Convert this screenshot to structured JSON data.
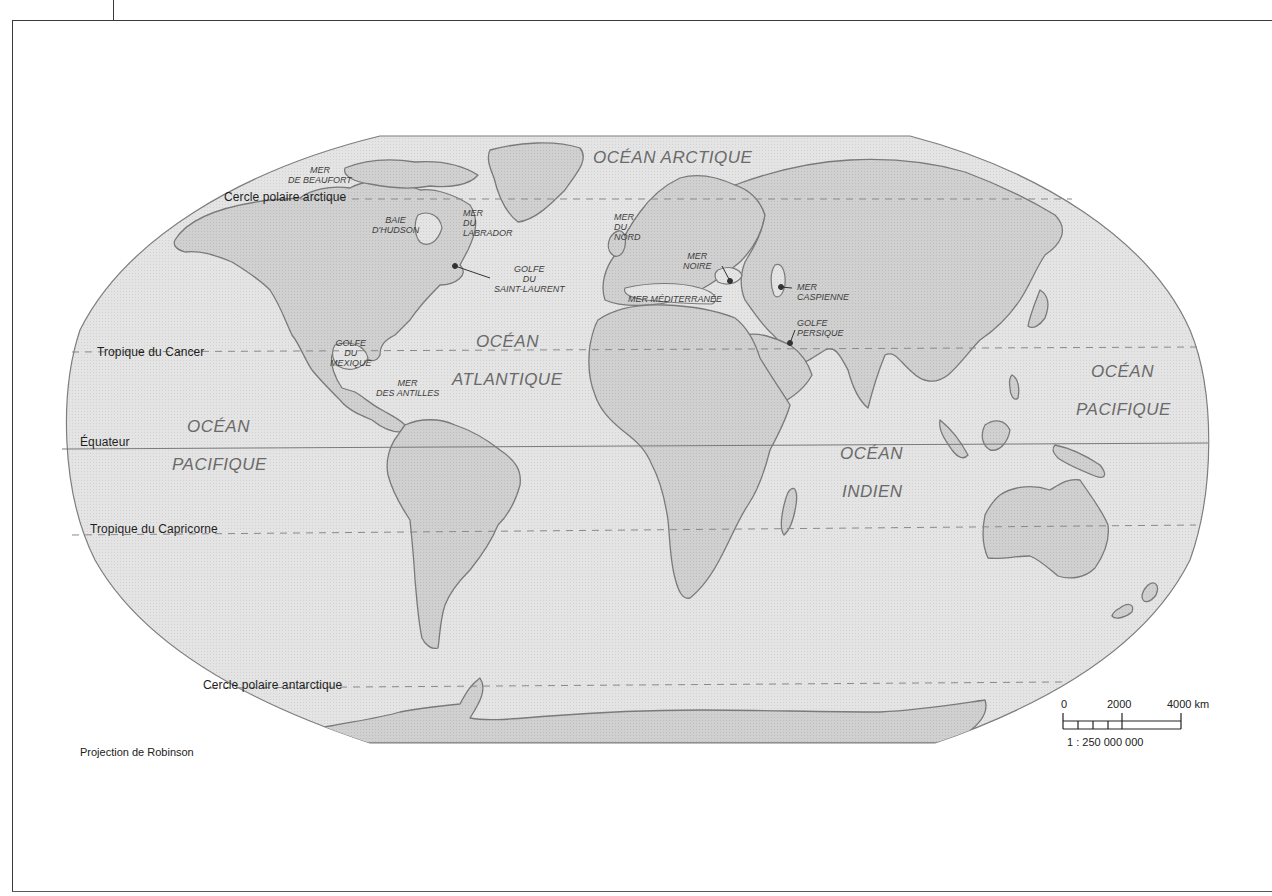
{
  "map": {
    "projection_label": "Projection de Robinson",
    "colors": {
      "ocean": "#e2e2e2",
      "land": "#cfcfcf",
      "coast": "#7a7a7a",
      "frame": "#3a3a3a",
      "graticule": "#8a8a8a"
    },
    "latitude_lines": [
      {
        "id": "arctic",
        "label": "Cercle polaire arctique",
        "style": "dashed"
      },
      {
        "id": "cancer",
        "label": "Tropique du Cancer",
        "style": "dashed"
      },
      {
        "id": "equator",
        "label": "Équateur",
        "style": "solid"
      },
      {
        "id": "capricorn",
        "label": "Tropique du Capricorne",
        "style": "dashed"
      },
      {
        "id": "antarctic",
        "label": "Cercle polaire antarctique",
        "style": "dashed"
      }
    ],
    "oceans": {
      "arctic": "OCÉAN ARCTIQUE",
      "atlantic_1": "OCÉAN",
      "atlantic_2": "ATLANTIQUE",
      "pacific_west_1": "OCÉAN",
      "pacific_west_2": "PACIFIQUE",
      "pacific_east_1": "OCÉAN",
      "pacific_east_2": "PACIFIQUE",
      "indian_1": "OCÉAN",
      "indian_2": "INDIEN"
    },
    "seas": {
      "beaufort": [
        "MER",
        "DE BEAUFORT"
      ],
      "hudson": [
        "BAIE",
        "D'HUDSON"
      ],
      "labrador": [
        "MER",
        "DU",
        "LABRADOR"
      ],
      "saint_laurent": [
        "GOLFE",
        "DU",
        "SAINT-LAURENT"
      ],
      "nord": [
        "MER",
        "DU",
        "NORD"
      ],
      "noire": [
        "MER",
        "NOIRE"
      ],
      "caspienne": [
        "MER",
        "CASPIENNE"
      ],
      "mediterranee": [
        "MER MÉDITERRANÉE"
      ],
      "persique": [
        "GOLFE",
        "PERSIQUE"
      ],
      "mexique": [
        "GOLFE",
        "DU",
        "MEXIQUE"
      ],
      "antilles": [
        "MER",
        "DES ANTILLES"
      ]
    },
    "scale_bar": {
      "ticks": [
        "0",
        "2000",
        "4000 km"
      ],
      "ratio": "1 : 250 000 000"
    }
  }
}
